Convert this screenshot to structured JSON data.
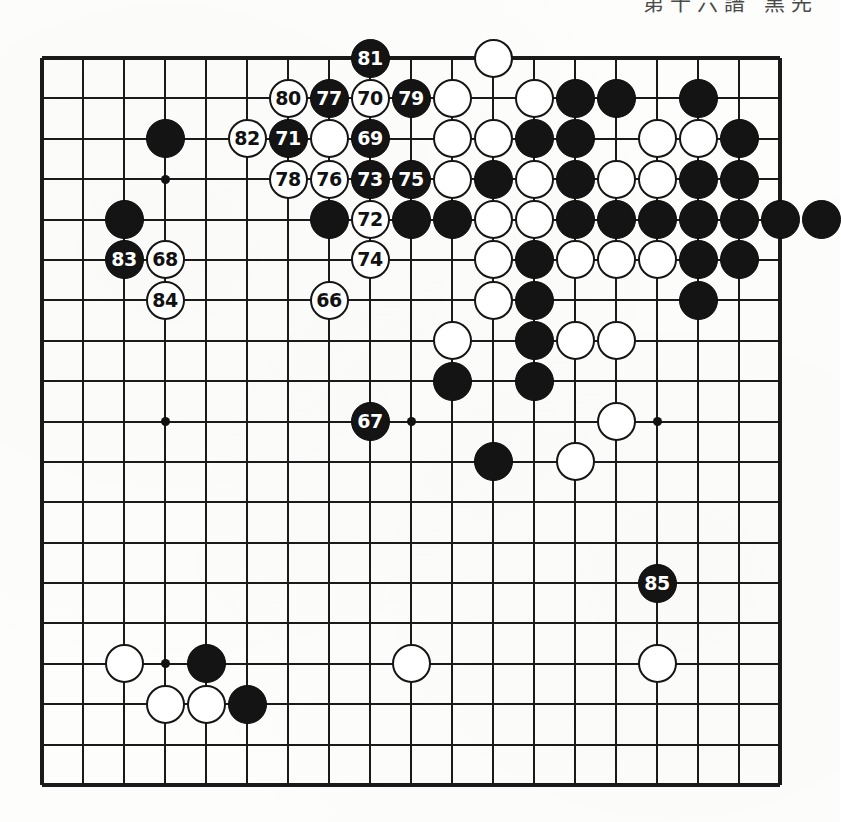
{
  "page": {
    "caption": "第十六譜 黒先",
    "board_size": 19,
    "colors": {
      "line": "#1a1a1a",
      "black_stone": "#141414",
      "white_stone": "#ffffff",
      "paper": "#fdfdfb",
      "black_label": "#ffffff",
      "white_label": "#111111"
    }
  },
  "board": {
    "star_points": [
      {
        "col": 3,
        "row": 3
      },
      {
        "col": 9,
        "row": 3
      },
      {
        "col": 15,
        "row": 3
      },
      {
        "col": 3,
        "row": 9
      },
      {
        "col": 9,
        "row": 9
      },
      {
        "col": 15,
        "row": 9
      },
      {
        "col": 3,
        "row": 15
      },
      {
        "col": 9,
        "row": 15
      },
      {
        "col": 15,
        "row": 15
      }
    ],
    "move_sequence_range": "66-85",
    "numbered_stones": [
      {
        "label": "66",
        "color": "white",
        "col": 7,
        "row": 6
      },
      {
        "label": "67",
        "color": "black",
        "col": 8,
        "row": 9
      },
      {
        "label": "68",
        "color": "white",
        "col": 3,
        "row": 5
      },
      {
        "label": "69",
        "color": "black",
        "col": 8,
        "row": 2
      },
      {
        "label": "70",
        "color": "white",
        "col": 8,
        "row": 1
      },
      {
        "label": "71",
        "color": "black",
        "col": 6,
        "row": 2
      },
      {
        "label": "72",
        "color": "white",
        "col": 8,
        "row": 4
      },
      {
        "label": "73",
        "color": "black",
        "col": 8,
        "row": 3
      },
      {
        "label": "74",
        "color": "white",
        "col": 8,
        "row": 5
      },
      {
        "label": "75",
        "color": "black",
        "col": 9,
        "row": 3
      },
      {
        "label": "76",
        "color": "white",
        "col": 7,
        "row": 3
      },
      {
        "label": "77",
        "color": "black",
        "col": 7,
        "row": 1
      },
      {
        "label": "78",
        "color": "white",
        "col": 6,
        "row": 3
      },
      {
        "label": "79",
        "color": "black",
        "col": 9,
        "row": 1
      },
      {
        "label": "80",
        "color": "white",
        "col": 6,
        "row": 1
      },
      {
        "label": "81",
        "color": "black",
        "col": 8,
        "row": 0
      },
      {
        "label": "82",
        "color": "white",
        "col": 5,
        "row": 2
      },
      {
        "label": "83",
        "color": "black",
        "col": 2,
        "row": 5
      },
      {
        "label": "84",
        "color": "white",
        "col": 3,
        "row": 6
      },
      {
        "label": "85",
        "color": "black",
        "col": 15,
        "row": 13
      }
    ],
    "plain_stones": [
      {
        "color": "white",
        "col": 11,
        "row": 0
      },
      {
        "color": "white",
        "col": 10,
        "row": 1
      },
      {
        "color": "white",
        "col": 12,
        "row": 1
      },
      {
        "color": "black",
        "col": 13,
        "row": 1
      },
      {
        "color": "black",
        "col": 14,
        "row": 1
      },
      {
        "color": "black",
        "col": 16,
        "row": 1
      },
      {
        "color": "black",
        "col": 3,
        "row": 2
      },
      {
        "color": "white",
        "col": 7,
        "row": 2
      },
      {
        "color": "white",
        "col": 10,
        "row": 2
      },
      {
        "color": "white",
        "col": 11,
        "row": 2
      },
      {
        "color": "black",
        "col": 12,
        "row": 2
      },
      {
        "color": "black",
        "col": 13,
        "row": 2
      },
      {
        "color": "white",
        "col": 15,
        "row": 2
      },
      {
        "color": "white",
        "col": 16,
        "row": 2
      },
      {
        "color": "black",
        "col": 17,
        "row": 2
      },
      {
        "color": "black",
        "col": 2,
        "row": 4
      },
      {
        "color": "white",
        "col": 10,
        "row": 3
      },
      {
        "color": "black",
        "col": 11,
        "row": 3
      },
      {
        "color": "white",
        "col": 12,
        "row": 3
      },
      {
        "color": "black",
        "col": 13,
        "row": 3
      },
      {
        "color": "white",
        "col": 14,
        "row": 3
      },
      {
        "color": "white",
        "col": 15,
        "row": 3
      },
      {
        "color": "black",
        "col": 16,
        "row": 3
      },
      {
        "color": "black",
        "col": 17,
        "row": 3
      },
      {
        "color": "black",
        "col": 7,
        "row": 4
      },
      {
        "color": "black",
        "col": 9,
        "row": 4
      },
      {
        "color": "black",
        "col": 10,
        "row": 4
      },
      {
        "color": "white",
        "col": 11,
        "row": 4
      },
      {
        "color": "white",
        "col": 12,
        "row": 4
      },
      {
        "color": "black",
        "col": 13,
        "row": 4
      },
      {
        "color": "black",
        "col": 14,
        "row": 4
      },
      {
        "color": "black",
        "col": 15,
        "row": 4
      },
      {
        "color": "black",
        "col": 16,
        "row": 4
      },
      {
        "color": "black",
        "col": 17,
        "row": 4
      },
      {
        "color": "black",
        "col": 18,
        "row": 4
      },
      {
        "color": "white",
        "col": 11,
        "row": 5
      },
      {
        "color": "black",
        "col": 12,
        "row": 5
      },
      {
        "color": "white",
        "col": 13,
        "row": 5
      },
      {
        "color": "white",
        "col": 14,
        "row": 5
      },
      {
        "color": "white",
        "col": 15,
        "row": 5
      },
      {
        "color": "black",
        "col": 16,
        "row": 5
      },
      {
        "color": "black",
        "col": 17,
        "row": 5
      },
      {
        "color": "white",
        "col": 11,
        "row": 6
      },
      {
        "color": "black",
        "col": 12,
        "row": 6
      },
      {
        "color": "black",
        "col": 16,
        "row": 6
      },
      {
        "color": "white",
        "col": 10,
        "row": 7
      },
      {
        "color": "black",
        "col": 12,
        "row": 7
      },
      {
        "color": "white",
        "col": 13,
        "row": 7
      },
      {
        "color": "white",
        "col": 14,
        "row": 7
      },
      {
        "color": "black",
        "col": 10,
        "row": 8
      },
      {
        "color": "black",
        "col": 12,
        "row": 8
      },
      {
        "color": "white",
        "col": 14,
        "row": 9
      },
      {
        "color": "black",
        "col": 11,
        "row": 10
      },
      {
        "color": "white",
        "col": 13,
        "row": 10
      },
      {
        "color": "white",
        "col": 2,
        "row": 15
      },
      {
        "color": "black",
        "col": 4,
        "row": 15
      },
      {
        "color": "white",
        "col": 9,
        "row": 15
      },
      {
        "color": "white",
        "col": 15,
        "row": 15
      },
      {
        "color": "white",
        "col": 3,
        "row": 16
      },
      {
        "color": "white",
        "col": 4,
        "row": 16
      },
      {
        "color": "black",
        "col": 5,
        "row": 16
      }
    ],
    "offboard_stones": [
      {
        "color": "black",
        "col": 19,
        "row": 4,
        "note": "right-edge overflow stone"
      }
    ]
  }
}
